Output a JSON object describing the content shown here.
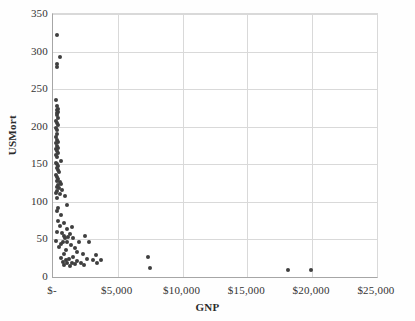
{
  "chart_data": {
    "type": "scatter",
    "title": "",
    "xlabel": "GNP",
    "ylabel": "USMort",
    "xlim": [
      0,
      25000
    ],
    "ylim": [
      0,
      350
    ],
    "grid": true,
    "legend": false,
    "xticks": [
      0,
      5000,
      10000,
      15000,
      20000,
      25000
    ],
    "xtick_labels": [
      "$-",
      "$5,000",
      "$10,000",
      "$15,000",
      "$20,000",
      "$25,000"
    ],
    "yticks": [
      0,
      50,
      100,
      150,
      200,
      250,
      300,
      350
    ],
    "ytick_labels": [
      "0",
      "50",
      "100",
      "150",
      "200",
      "250",
      "300",
      "350"
    ],
    "marker_color": "#3f3f3f",
    "marker_size": 4,
    "points": [
      [
        330,
        322
      ],
      [
        560,
        293
      ],
      [
        300,
        283
      ],
      [
        300,
        279
      ],
      [
        250,
        235
      ],
      [
        330,
        228
      ],
      [
        360,
        224
      ],
      [
        300,
        222
      ],
      [
        410,
        220
      ],
      [
        330,
        218
      ],
      [
        290,
        215
      ],
      [
        380,
        212
      ],
      [
        250,
        208
      ],
      [
        300,
        205
      ],
      [
        400,
        202
      ],
      [
        260,
        198
      ],
      [
        330,
        195
      ],
      [
        280,
        190
      ],
      [
        240,
        186
      ],
      [
        330,
        182
      ],
      [
        420,
        180
      ],
      [
        270,
        178
      ],
      [
        310,
        175
      ],
      [
        360,
        172
      ],
      [
        250,
        170
      ],
      [
        300,
        168
      ],
      [
        390,
        165
      ],
      [
        270,
        162
      ],
      [
        330,
        160
      ],
      [
        600,
        155
      ],
      [
        250,
        152
      ],
      [
        320,
        150
      ],
      [
        410,
        148
      ],
      [
        280,
        145
      ],
      [
        350,
        142
      ],
      [
        480,
        140
      ],
      [
        260,
        136
      ],
      [
        330,
        133
      ],
      [
        420,
        131
      ],
      [
        290,
        128
      ],
      [
        520,
        126
      ],
      [
        620,
        124
      ],
      [
        360,
        122
      ],
      [
        280,
        120
      ],
      [
        440,
        118
      ],
      [
        700,
        116
      ],
      [
        330,
        114
      ],
      [
        260,
        112
      ],
      [
        560,
        110
      ],
      [
        900,
        108
      ],
      [
        310,
        105
      ],
      [
        1050,
        96
      ],
      [
        420,
        92
      ],
      [
        330,
        88
      ],
      [
        620,
        82
      ],
      [
        390,
        74
      ],
      [
        820,
        72
      ],
      [
        540,
        68
      ],
      [
        1480,
        66
      ],
      [
        1060,
        64
      ],
      [
        310,
        60
      ],
      [
        700,
        58
      ],
      [
        1330,
        57
      ],
      [
        880,
        55
      ],
      [
        2450,
        55
      ],
      [
        1180,
        53
      ],
      [
        960,
        52
      ],
      [
        1560,
        52
      ],
      [
        250,
        48
      ],
      [
        760,
        47
      ],
      [
        1100,
        46
      ],
      [
        2000,
        46
      ],
      [
        2750,
        46
      ],
      [
        640,
        44
      ],
      [
        1380,
        43
      ],
      [
        480,
        40
      ],
      [
        1720,
        38
      ],
      [
        1040,
        36
      ],
      [
        1880,
        33
      ],
      [
        860,
        31
      ],
      [
        2350,
        30
      ],
      [
        3300,
        29
      ],
      [
        1560,
        27
      ],
      [
        620,
        25
      ],
      [
        1240,
        24
      ],
      [
        2600,
        24
      ],
      [
        3050,
        23
      ],
      [
        3700,
        23
      ],
      [
        980,
        22
      ],
      [
        1880,
        21
      ],
      [
        760,
        20
      ],
      [
        1460,
        19
      ],
      [
        2180,
        19
      ],
      [
        3400,
        19
      ],
      [
        1080,
        18
      ],
      [
        1720,
        17
      ],
      [
        880,
        16
      ],
      [
        2420,
        16
      ],
      [
        1320,
        15
      ],
      [
        7350,
        26
      ],
      [
        7500,
        12
      ],
      [
        18100,
        9
      ],
      [
        19900,
        9
      ]
    ]
  }
}
